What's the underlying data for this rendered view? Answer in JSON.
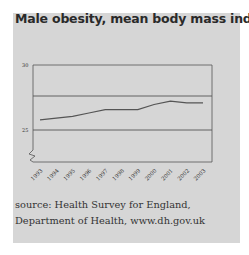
{
  "title": "Male obesity, mean body mass index",
  "source": "source: Health Survey for England, Department of Health, www.dh.gov.uk",
  "chart_data": {
    "type": "line",
    "title": "Male obesity, mean body mass index",
    "xlabel": "",
    "ylabel": "",
    "categories": [
      "1993",
      "1994",
      "1995",
      "1996",
      "1997",
      "1998",
      "1999",
      "2000",
      "2001",
      "2002",
      "2003"
    ],
    "series": [
      {
        "name": "Mean BMI (men)",
        "values": [
          25.6,
          25.7,
          25.8,
          26.0,
          26.2,
          26.2,
          26.2,
          26.5,
          26.7,
          26.6,
          26.6
        ]
      }
    ],
    "yticks": [
      25,
      30
    ],
    "ylim": [
      23.5,
      30
    ],
    "axis_break": true,
    "grid": true,
    "colors": {
      "line": "#555555",
      "grid": "#555555",
      "background": "#d6d6d6"
    }
  }
}
